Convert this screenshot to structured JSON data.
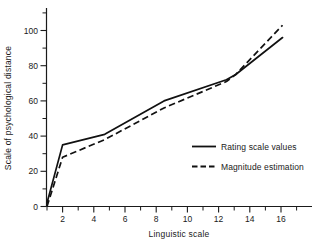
{
  "chart_data": {
    "type": "line",
    "title": "",
    "xlabel": "Linguistic scale",
    "ylabel": "Scale of psychological distance",
    "xlim": [
      0.2,
      17.2
    ],
    "ylim": [
      -4,
      112
    ],
    "grid": false,
    "legend_position": "center-right",
    "x_ticks_major": [
      2,
      4,
      6,
      8,
      10,
      12,
      14,
      16
    ],
    "x_ticks_minor": [
      1,
      3,
      5,
      7,
      9,
      11,
      13,
      15,
      17
    ],
    "x_tick_labels": [
      "2",
      "4",
      "6",
      "8",
      "10",
      "12",
      "14",
      "16"
    ],
    "y_ticks_major": [
      0,
      20,
      40,
      60,
      80,
      100
    ],
    "y_ticks_minor": [
      10,
      30,
      50,
      70,
      90,
      110
    ],
    "y_tick_labels": [
      "0",
      "20",
      "40",
      "60",
      "80",
      "100"
    ],
    "series": [
      {
        "name": "Rating scale values",
        "style": "solid",
        "color": "#111111",
        "x": [
          1,
          2,
          4.7,
          8.5,
          12.5,
          13.1,
          16.1
        ],
        "values": [
          2,
          35,
          41,
          60,
          72,
          75,
          96
        ]
      },
      {
        "name": "Magnitude estimation",
        "style": "dashed",
        "color": "#111111",
        "x": [
          1,
          2,
          4.7,
          8.5,
          12.5,
          13.1,
          16.1
        ],
        "values": [
          0,
          28,
          38,
          56,
          71,
          75,
          103
        ]
      }
    ]
  },
  "legend": {
    "entries": [
      {
        "label": "Rating scale values",
        "style": "solid"
      },
      {
        "label": "Magnitude estimation",
        "style": "dashed"
      }
    ]
  },
  "axes": {
    "x_title": "Linguistic scale",
    "y_title": "Scale of psychological distance",
    "x_labels": [
      "2",
      "4",
      "6",
      "8",
      "10",
      "12",
      "14",
      "16"
    ],
    "y_labels": [
      "0",
      "20",
      "40",
      "60",
      "80",
      "100"
    ]
  }
}
